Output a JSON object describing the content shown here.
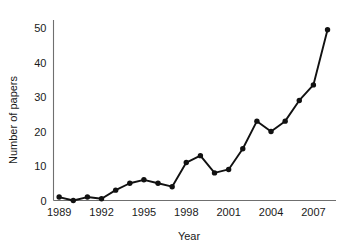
{
  "chart_data": {
    "type": "line",
    "title": "",
    "xlabel": "Year",
    "ylabel": "Number of papers",
    "x": [
      1989,
      1990,
      1991,
      1992,
      1993,
      1994,
      1995,
      1996,
      1997,
      1998,
      1999,
      2000,
      2001,
      2002,
      2003,
      2004,
      2005,
      2006,
      2007,
      2008
    ],
    "values": [
      1,
      0,
      1,
      0.5,
      3,
      5,
      6,
      5,
      4,
      11,
      13,
      8,
      9,
      15,
      23,
      20,
      23,
      29,
      33.5,
      49.5
    ],
    "series": [
      {
        "name": "Number of papers",
        "values": [
          1,
          0,
          1,
          0.5,
          3,
          5,
          6,
          5,
          4,
          11,
          13,
          8,
          9,
          15,
          23,
          20,
          23,
          29,
          33.5,
          49.5
        ]
      }
    ],
    "xlim": [
      1988.6,
      2008.6
    ],
    "ylim": [
      0,
      53
    ],
    "xticks": [
      1989,
      1992,
      1995,
      1998,
      2001,
      2004,
      2007
    ],
    "xtick_labels": [
      "1989",
      "1992",
      "1995",
      "1998",
      "2001",
      "2004",
      "2007"
    ],
    "yticks": [
      0,
      10,
      20,
      30,
      40,
      50
    ],
    "ytick_labels": [
      "0",
      "10",
      "20",
      "30",
      "40",
      "50"
    ],
    "grid": false,
    "legend": false,
    "marker": "filled-circle",
    "line_color": "#111111",
    "marker_color": "#111111",
    "axis_color": "#6f6f6f",
    "background_color": "#ffffff"
  },
  "axes": {
    "x_title": "Year",
    "y_title": "Number of papers"
  }
}
